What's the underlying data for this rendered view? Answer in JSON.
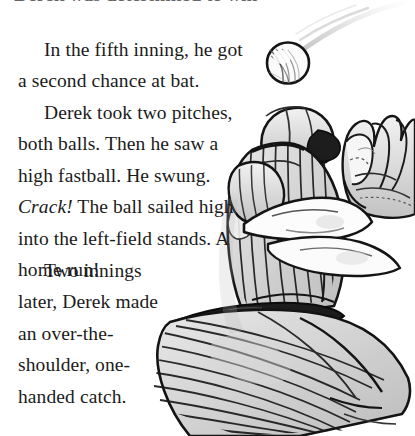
{
  "page": {
    "background_color": "#ffffff",
    "ink_color": "#1b1b1b",
    "width": 415,
    "height": 436
  },
  "body_text": {
    "clipped_top_line": "Derek was determined to win this game.",
    "paragraph_1": "In the fifth inning, he got a second chance at bat.",
    "paragraph_2_part_1": "Derek took two pitches, both balls. Then he saw a high fastball. He swung. ",
    "paragraph_2_emphasis": "Crack!",
    "paragraph_2_part_2": " The ball sailed high into the left-field stands. A home run!",
    "paragraph_3": "Two innings later, Derek made an over-the-shoulder, one-handed catch."
  },
  "illustration": {
    "caption_name": "baseball-player-catching-illustration",
    "subject": "baseball player in pinstriped uniform reaching up with glove",
    "elements": [
      "baseball",
      "motion-trail",
      "batting-helmet",
      "player-face",
      "pinstriped-jersey",
      "bare-arms",
      "fielders-glove",
      "belt",
      "pinstriped-pants"
    ],
    "style": "black ink line art with gray wash",
    "line_color": "#121212",
    "wash_color": "#c9c9c9",
    "pinstripe_color": "#1a1a1a"
  }
}
